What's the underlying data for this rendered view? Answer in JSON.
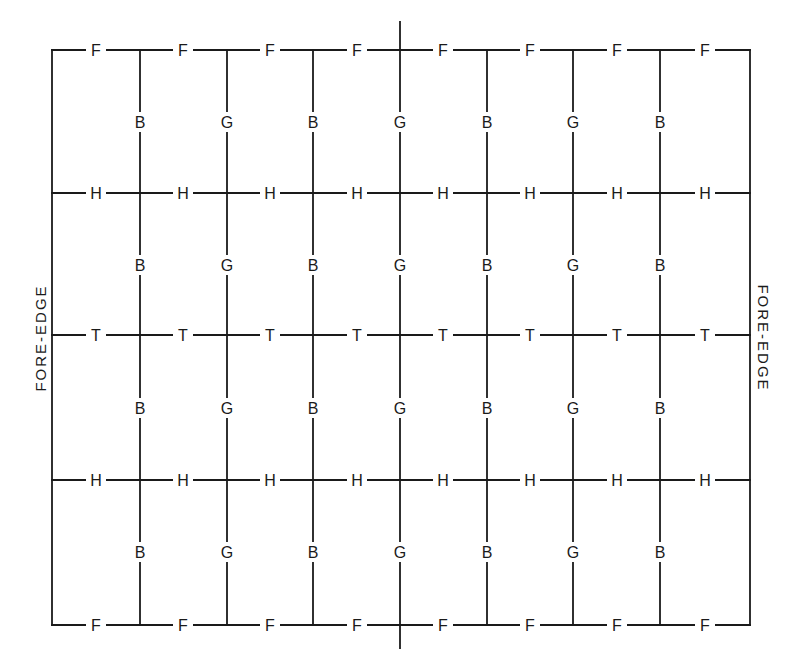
{
  "diagram": {
    "side_labels": {
      "left": "FORE-EDGE",
      "right": "FORE-EDGE"
    },
    "frame": {
      "left": 52,
      "right": 750,
      "top": 50,
      "bottom": 625
    },
    "center_fold": {
      "x": 400,
      "top": 22,
      "bottom": 648
    },
    "vertical_lines_x": [
      140,
      227,
      313,
      400,
      487,
      573,
      660
    ],
    "rows": [
      {
        "y": 50,
        "letter": "F"
      },
      {
        "y": 193,
        "letter": "H"
      },
      {
        "y": 335,
        "letter": "T"
      },
      {
        "y": 480,
        "letter": "H"
      },
      {
        "y": 625,
        "letter": "F"
      }
    ],
    "row_label_x": [
      96,
      183,
      270,
      357,
      443,
      530,
      617,
      705
    ],
    "column_letters": [
      "B",
      "G",
      "B",
      "G",
      "B",
      "G",
      "B"
    ],
    "column_label_y": [
      122,
      265,
      408,
      552
    ],
    "line_color": "#1a1a1a",
    "background": "#ffffff"
  }
}
